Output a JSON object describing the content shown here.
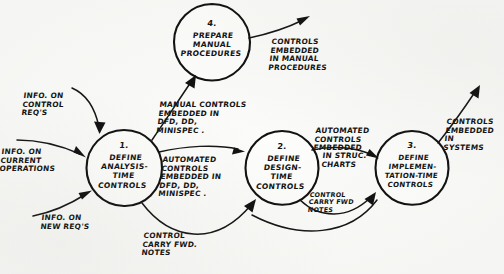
{
  "diagram": {
    "type": "data-flow-diagram",
    "style": "hand-drawn",
    "ink_color": "#111111",
    "paper_color": "#fbfbf9",
    "processes": [
      {
        "id": "p1",
        "number": "1.",
        "name": "DEFINE\nANALYSIS-\nTIME\nCONTROLS",
        "cx": 124,
        "cy": 168,
        "r": 38
      },
      {
        "id": "p2",
        "number": "2.",
        "name": "DEFINE\nDESIGN-\nTIME\nCONTROLS",
        "cx": 282,
        "cy": 168,
        "r": 37
      },
      {
        "id": "p3",
        "number": "3.",
        "name": "DEFINE\nIMPLEMEN-\nTATION-TIME\nCONTROLS",
        "cx": 412,
        "cy": 168,
        "r": 37
      },
      {
        "id": "p4",
        "number": "4.",
        "name": "PREPARE\nMANUAL\nPROCEDURES",
        "cx": 212,
        "cy": 42,
        "r": 38
      }
    ],
    "flows": [
      {
        "id": "f1",
        "label": "INFO. ON\nCONTROL\nREQ'S",
        "from": "external",
        "to": "p1",
        "label_x": 24,
        "label_y": 92
      },
      {
        "id": "f2",
        "label": "INFO. ON\nCURRENT\nOPERATIONS",
        "from": "external",
        "to": "p1",
        "label_x": 2,
        "label_y": 148
      },
      {
        "id": "f3",
        "label": "INFO. ON\nNEW REQ'S",
        "from": "external",
        "to": "p1",
        "label_x": 42,
        "label_y": 214
      },
      {
        "id": "f4",
        "label": "MANUAL CONTROLS\nEMBEDDED IN\nDFD, DD,\nMINISPEC .",
        "from": "p1",
        "to": "p4",
        "label_x": 160,
        "label_y": 101
      },
      {
        "id": "f5",
        "label": "CONTROLS\nEMBEDDED\nIN MANUAL\nPROCEDURES",
        "from": "p4",
        "to": "external",
        "label_x": 272,
        "label_y": 38
      },
      {
        "id": "f6",
        "label": "AUTOMATED\nCONTROLS\nEMBEDDED IN\nDFD, DD,\nMINISPEC .",
        "from": "p1",
        "to": "p2",
        "label_x": 163,
        "label_y": 156
      },
      {
        "id": "f7",
        "label": "CONTROL\nCARRY FWD.\nNOTES",
        "from": "p1",
        "to": "p2",
        "label_x": 144,
        "label_y": 232
      },
      {
        "id": "f8",
        "label": "AUTOMATED\nCONTROLS\nEMBEDDED",
        "from": "p2",
        "to": "p3",
        "label_x": 316,
        "label_y": 127
      },
      {
        "id": "f9",
        "label": "IN STRUC.\nCHARTS",
        "from": "p2",
        "to": "p3",
        "label_x": 323,
        "label_y": 152
      },
      {
        "id": "f10",
        "label": "CONTROL\nCARRY FWD\nNOTES",
        "from": "p2",
        "to": "p3",
        "label_x": 310,
        "label_y": 192
      },
      {
        "id": "f11",
        "label": "CONTROLS\nEMBEDDED\nIN\nSYSTEMS",
        "from": "p3",
        "to": "external",
        "label_x": 447,
        "label_y": 118
      }
    ]
  }
}
